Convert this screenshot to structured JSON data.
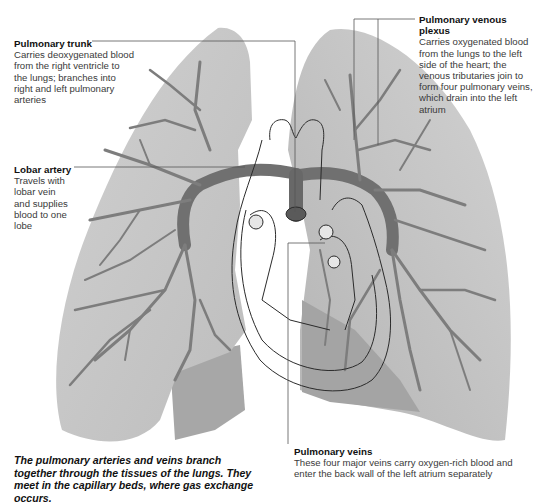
{
  "diagram": {
    "colors": {
      "lung_fill": "#c8c8c8",
      "lung_shadow": "#a9a9a9",
      "vessel": "#7d7d7d",
      "vessel_dark": "#5e5e5e",
      "heart_outline": "#2b2b2b",
      "leader_line": "#555555"
    }
  },
  "callouts": {
    "pulmonary_trunk": {
      "title": "Pulmonary trunk",
      "body": "Carries deoxygenated blood from the right ventricle to the lungs; branches into right and left pulmonary arteries"
    },
    "pulmonary_venous_plexus": {
      "title": "Pulmonary venous plexus",
      "body": "Carries oxygenated blood from the lungs to the left side of the heart; the venous tributaries join to form four pulmonary veins, which drain into the left atrium"
    },
    "lobar_artery": {
      "title": "Lobar artery",
      "body": "Travels with lobar vein and supplies blood to one lobe"
    },
    "pulmonary_veins": {
      "title": "Pulmonary veins",
      "body": "These four major veins carry oxygen-rich blood and enter the back wall of the left atrium separately"
    }
  },
  "caption": "The pulmonary arteries and veins branch together through the tissues of the lungs. They meet in the capillary beds, where gas exchange occurs."
}
